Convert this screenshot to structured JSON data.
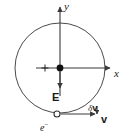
{
  "figure": {
    "type": "physics-diagram",
    "width": 127,
    "height": 137,
    "background_color": "#ffffff",
    "stroke_color": "#3a3a3a",
    "text_color": "#1a1a1a"
  },
  "axes": {
    "x_label": "x",
    "y_label": "y",
    "origin": {
      "x": 60,
      "y": 68
    },
    "x_axis": {
      "from_x": 36,
      "to_x": 113,
      "y": 68,
      "arrow": "right"
    },
    "y_axis": {
      "x": 60,
      "from_y": 96,
      "to_y": 4,
      "arrow": "up"
    }
  },
  "orbit": {
    "name": "circular-orbit",
    "center_x": 60,
    "center_y": 68,
    "radius": 45,
    "stroke_color": "#4a4a4a",
    "stroke_width": 1
  },
  "nucleus": {
    "charge_label": "+",
    "dot_x": 60,
    "dot_y": 68,
    "dot_radius": 3.4,
    "plus_x": 45,
    "plus_y": 68,
    "fill_color": "#111111"
  },
  "electron": {
    "label": "e",
    "charge_sign": "−",
    "x": 57,
    "y": 114,
    "radius": 3,
    "fill_color": "#ffffff",
    "stroke_color": "#333333"
  },
  "field_arrow": {
    "label": "E",
    "description": "electric field pointing toward the nucleus (downward)",
    "from_x": 60,
    "from_y": 72,
    "to_x": 60,
    "to_y": 90
  },
  "velocity_arrow": {
    "label": "v",
    "description": "tangential velocity of the electron (rightward)",
    "from_x": 61,
    "from_y": 114,
    "to_x": 97,
    "to_y": 114
  },
  "delta_velocity_arrow": {
    "label_delta": "δ",
    "label_vector": "v",
    "label": "δv",
    "description": "small velocity change directed downward",
    "from_x": 97,
    "from_y": 106,
    "to_x": 97,
    "to_y": 116
  }
}
